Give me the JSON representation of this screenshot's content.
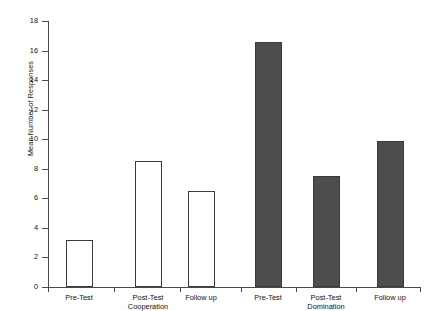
{
  "chart_data": {
    "type": "bar",
    "title": "",
    "subtitle": "",
    "xlabel": "",
    "ylabel": "Mean Number of Responses",
    "ylim": [
      0,
      18
    ],
    "yticks": [
      0,
      2,
      4,
      6,
      8,
      10,
      12,
      14,
      16,
      18
    ],
    "ytick_labels": [
      "0",
      "2",
      "4",
      "6",
      "8",
      "10",
      "12",
      "14",
      "16",
      "18"
    ],
    "grid": false,
    "legend": "none",
    "categories": [
      "Pre-Test",
      "Post-Test",
      "Follow up",
      "Pre-Test",
      "Post-Test",
      "Follow up"
    ],
    "groups": [
      {
        "name": "Cooperation",
        "style": "open",
        "fill_color": "#ffffff",
        "edge_color": "#3a3a3a",
        "categories": [
          "Pre-Test",
          "Post-Test",
          "Follow up"
        ],
        "values": [
          3.2,
          8.5,
          6.5
        ]
      },
      {
        "name": "Domination",
        "style": "filled",
        "fill_color": "#4d4d4d",
        "edge_color": "#3a3a3a",
        "categories": [
          "Pre-Test",
          "Post-Test",
          "Follow up"
        ],
        "values": [
          16.6,
          7.5,
          9.9
        ]
      }
    ],
    "values": [
      3.2,
      8.5,
      6.5,
      16.6,
      7.5,
      9.9
    ],
    "bars": [
      {
        "label": "Pre-Test",
        "group": "Cooperation",
        "value": 3.2,
        "style": "open"
      },
      {
        "label": "Post-Test",
        "group": "Cooperation",
        "value": 8.5,
        "style": "open"
      },
      {
        "label": "Follow up",
        "group": "Cooperation",
        "value": 6.5,
        "style": "open"
      },
      {
        "label": "Pre-Test",
        "group": "Domination",
        "value": 16.6,
        "style": "filled"
      },
      {
        "label": "Post-Test",
        "group": "Domination",
        "value": 7.5,
        "style": "filled"
      },
      {
        "label": "Follow up",
        "group": "Domination",
        "value": 9.9,
        "style": "filled"
      }
    ]
  },
  "axis": {
    "y_label": "Mean Number of Responses",
    "y_ticks": [
      "18",
      "16",
      "14",
      "12",
      "10",
      "8",
      "6",
      "4",
      "2",
      "0"
    ]
  },
  "x_labels": [
    "Pre-Test",
    "Post-Test",
    "Follow up",
    "Pre-Test",
    "Post-Test",
    "Follow up"
  ],
  "group_labels": [
    "Cooperation",
    "Domination"
  ]
}
